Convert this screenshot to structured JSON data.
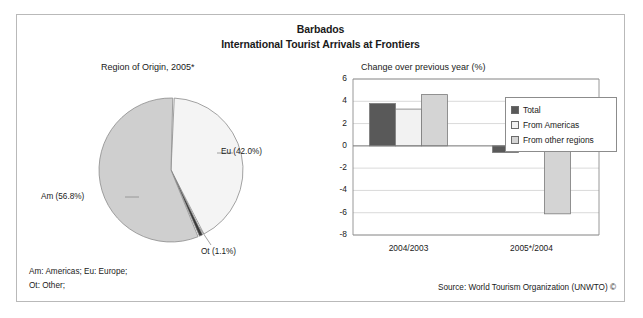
{
  "figure": {
    "title": "Barbados",
    "subtitle": "International Tourist Arrivals at Frontiers",
    "pie_caption": "Region of Origin, 2005*",
    "bar_caption": "Change over previous year (%)",
    "footnote_line1": "Am: Americas; Eu: Europe;",
    "footnote_line2": "Ot: Other;",
    "source": "Source: World Tourism Organization (UNWTO) ©"
  },
  "colors": {
    "border": "#b9b9b9",
    "pie_americas": "#cfcfcf",
    "pie_europe": "#f4f4f4",
    "pie_other": "#3a3a3a",
    "bar_total": "#595959",
    "bar_from_americas": "#f2f2f2",
    "bar_other_regions": "#d4d4d4",
    "gridline": "#c8c8c8",
    "axis": "#8c8c8c",
    "text": "#1a1a1a"
  },
  "chart_data": [
    {
      "type": "pie",
      "title": "Region of Origin, 2005*",
      "legend_position": "callout-labels",
      "categories": [
        "Am",
        "Eu",
        "Ot"
      ],
      "labels": [
        "Am (56.8%)",
        "Eu (42.0%)",
        "Ot (1.1%)"
      ],
      "values": [
        56.8,
        42.0,
        1.1
      ],
      "slice_colors": [
        "#cfcfcf",
        "#f4f4f4",
        "#3a3a3a"
      ],
      "units": "%"
    },
    {
      "type": "bar",
      "title": "Change over previous year (%)",
      "xlabel": "",
      "ylabel": "",
      "ylim": [
        -8,
        6
      ],
      "yticks": [
        6,
        4,
        2,
        0,
        -2,
        -4,
        -6,
        -8
      ],
      "ytick_labels": [
        "6",
        "4",
        "2",
        "0",
        "-2",
        "-4",
        "-6",
        "-8"
      ],
      "grid": true,
      "legend_position": "top-right",
      "categories": [
        "2004/2003",
        "2005*/2004"
      ],
      "series": [
        {
          "name": "Total",
          "values": [
            3.8,
            -0.6
          ],
          "color": "#595959"
        },
        {
          "name": "From Americas",
          "values": [
            3.3,
            3.3
          ],
          "color": "#f2f2f2"
        },
        {
          "name": "From other regions",
          "values": [
            4.6,
            -6.1
          ],
          "color": "#d4d4d4"
        }
      ]
    }
  ]
}
